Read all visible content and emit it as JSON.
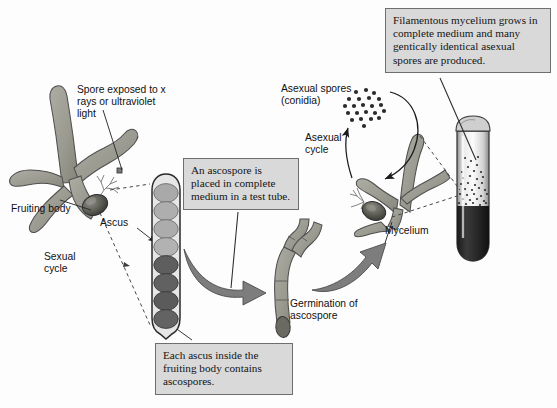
{
  "figure": {
    "background_color": "#fdfdfd",
    "callout_fill": "#d9d9d9",
    "callout_border": "#6e6e6e",
    "hypha_fill": "#9a9a92",
    "hypha_stroke": "#4a4a4a",
    "spore_light": "#a9a9a9",
    "spore_dark": "#5e5e5e",
    "arrow_fill": "#7d7d7d"
  },
  "callouts": {
    "filamentous": "Filamentous mycelium grows in complete medium and many gentically identical asexual spores are produced.",
    "ascospore_placed": "An ascospore is placed in complete medium in a test tube.",
    "each_ascus": "Each ascus inside the fruiting body contains ascospores."
  },
  "labels": {
    "spore_exposed": "Spore exposed to x rays or ultraviolet light",
    "fruiting_body": "Fruiting body",
    "sexual_cycle": "Sexual cycle",
    "ascus": "Ascus",
    "asexual_spores": "Asexual spores (conidia)",
    "asexual_cycle": "Asexual cycle",
    "germination": "Germination of ascospore",
    "mycelium": "Mycelium"
  },
  "structures": {
    "ascus": {
      "spore_count": 8,
      "light_spores": 4,
      "dark_spores": 4
    },
    "conidia": {
      "dot_count": 22
    },
    "test_tube": {
      "has_stopper": true,
      "medium_color": "#2c2c2c",
      "speckle_count": 34
    }
  }
}
